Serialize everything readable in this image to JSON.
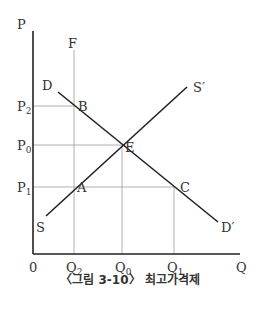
{
  "diagram": {
    "axes": {
      "y_label": "P",
      "x_label": "Q",
      "origin_label": "0"
    },
    "price_labels": [
      {
        "base": "P",
        "sub": "2"
      },
      {
        "base": "P",
        "sub": "0"
      },
      {
        "base": "P",
        "sub": "1"
      }
    ],
    "quantity_labels": [
      {
        "base": "Q",
        "sub": "2"
      },
      {
        "base": "Q",
        "sub": "0"
      },
      {
        "base": "Q",
        "sub": "1"
      }
    ],
    "curves": {
      "demand_start": "D",
      "demand_end": "D′",
      "supply_start": "S",
      "supply_end": "S′",
      "vertical_line": "F"
    },
    "points": {
      "B": "B",
      "E": "E",
      "A": "A",
      "C": "C"
    },
    "caption": "〈그림 3-10〉 최고가격제",
    "colors": {
      "axis": "#222222",
      "curve": "#222222",
      "guide": "#999999",
      "text": "#333333"
    }
  }
}
